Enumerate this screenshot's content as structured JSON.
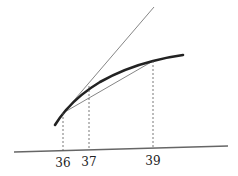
{
  "diagram": {
    "type": "tangent-secant-curve",
    "colors": {
      "curve": "#222222",
      "tangent": "#666666",
      "secant": "#666666",
      "guide": "#555555",
      "baseline": "#666666"
    },
    "x_labels": [
      {
        "text": "36",
        "x": 63
      },
      {
        "text": "37",
        "x": 89
      },
      {
        "text": "39",
        "x": 153
      }
    ]
  }
}
